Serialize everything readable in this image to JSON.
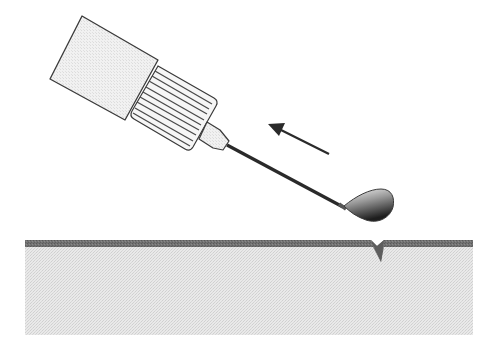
{
  "diagram": {
    "canvas": {
      "width": 503,
      "height": 357,
      "background": "#ffffff"
    },
    "colors": {
      "outline": "#3a3a3a",
      "barrel_fill": "#e6e6e6",
      "hub_fill": "#f4f4f4",
      "hub_ribs": "#4a4a4a",
      "connector_fill": "#ececec",
      "needle": "#2a2a2a",
      "droplet_light": "#f2f2f2",
      "droplet_dark": "#1e1e1e",
      "arrow": "#2a2a2a",
      "surface_band": "#6f6f6f",
      "substrate_fill": "#e8e8e8"
    },
    "elements": {
      "syringe_barrel": {
        "label": "syringe barrel"
      },
      "syringe_hub": {
        "label": "ribbed needle hub",
        "rib_count": 9
      },
      "needle_connector": {
        "label": "needle connector"
      },
      "needle": {
        "label": "needle"
      },
      "droplet": {
        "label": "droplet at needle tip"
      },
      "motion_arrow": {
        "label": "direction of needle withdrawal",
        "direction": "up-left"
      },
      "substrate": {
        "label": "substrate"
      },
      "surface_layer": {
        "label": "surface layer"
      },
      "surface_notch": {
        "label": "notch / defect in surface"
      }
    }
  }
}
